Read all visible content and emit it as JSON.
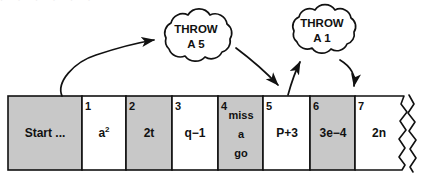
{
  "figure": {
    "colors": {
      "ink": "#111111",
      "cell_shaded": "#c8c8c8",
      "cell_plain": "#ffffff",
      "page_background": "#ffffff"
    }
  },
  "ghost_text": "· ·  · ·   · ·",
  "clouds": [
    {
      "id": "cloud-throw-a-5",
      "line1": "THROW",
      "line2": "A 5",
      "cx": 196,
      "cy": 40
    },
    {
      "id": "cloud-throw-a-1",
      "line1": "THROW",
      "line2": "A 1",
      "cx": 322,
      "cy": 33
    }
  ],
  "arrows": [
    {
      "id": "arrow-start-to-cloud-5",
      "from": "start-cell",
      "to": "cloud-throw-a-5"
    },
    {
      "id": "arrow-cloud-5-to-cell-5",
      "from": "cloud-throw-a-5",
      "to": "cell-5"
    },
    {
      "id": "arrow-cell-5-to-cloud-1",
      "from": "cell-5",
      "to": "cloud-throw-a-1"
    },
    {
      "id": "arrow-cloud-1-to-cell-7",
      "from": "cloud-throw-a-1",
      "to": "cell-7"
    }
  ],
  "track": {
    "left": 8,
    "top": 96,
    "bottom": 170,
    "cells": [
      {
        "number": "",
        "label": "Start ...",
        "shaded": true,
        "x": 8,
        "w": 74,
        "multiline": false
      },
      {
        "number": "1",
        "label": "a2",
        "shaded": false,
        "x": 82,
        "w": 44,
        "multiline": false,
        "superscript": "2",
        "base": "a"
      },
      {
        "number": "2",
        "label": "2t",
        "shaded": true,
        "x": 126,
        "w": 46,
        "multiline": false
      },
      {
        "number": "3",
        "label": "q−1",
        "shaded": false,
        "x": 172,
        "w": 46,
        "multiline": false
      },
      {
        "number": "4",
        "label": "miss a go",
        "shaded": true,
        "x": 218,
        "w": 45,
        "multiline": true,
        "lines": [
          "miss",
          "a",
          "go"
        ]
      },
      {
        "number": "5",
        "label": "P+3",
        "shaded": false,
        "x": 263,
        "w": 47,
        "multiline": false
      },
      {
        "number": "6",
        "label": "3e−4",
        "shaded": true,
        "x": 310,
        "w": 45,
        "multiline": false
      },
      {
        "number": "7",
        "label": "2n",
        "shaded": false,
        "x": 355,
        "w": 50,
        "multiline": false,
        "torn_right_edge": true
      }
    ]
  }
}
